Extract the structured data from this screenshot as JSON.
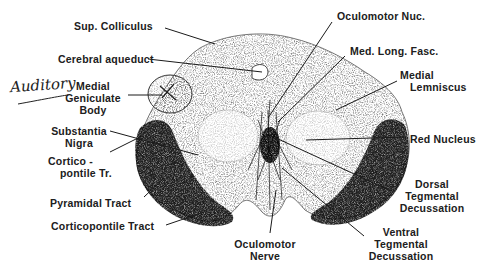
{
  "diagram": {
    "type": "anatomical-cross-section",
    "annotation_handwritten": "Auditory",
    "labels": [
      {
        "id": "sup-colliculus",
        "text": "Sup. Colliculus"
      },
      {
        "id": "cerebral-aqueduct",
        "text": "Cerebral aqueduct"
      },
      {
        "id": "medial-geniculate-body",
        "text": "Medial\nGeniculate\nBody",
        "lines": [
          "Medial",
          "Geniculate",
          "Body"
        ]
      },
      {
        "id": "substantia-nigra",
        "text": "Substantia Nigra",
        "lines": [
          "Substantia",
          "Nigra"
        ]
      },
      {
        "id": "corticopontile-tr",
        "text": "Cortico-pontile Tr.",
        "lines": [
          "Cortico -",
          "pontile  Tr."
        ]
      },
      {
        "id": "pyramidal-tract",
        "text": "Pyramidal Tract"
      },
      {
        "id": "corticopontile-tract",
        "text": "Corticopontile Tract"
      },
      {
        "id": "oculomotor-nerve",
        "text": "Oculomotor Nerve",
        "lines": [
          "Oculomotor",
          "Nerve"
        ]
      },
      {
        "id": "ventral-tegmental-decussation",
        "text": "Ventral Tegmental Decussation",
        "lines": [
          "Ventral",
          "Tegmental",
          "Decussation"
        ]
      },
      {
        "id": "dorsal-tegmental-decussation",
        "text": "Dorsal Tegmental Decussation",
        "lines": [
          "Dorsal",
          "Tegmental",
          "Decussation"
        ]
      },
      {
        "id": "red-nucleus",
        "text": "Red Nucleus"
      },
      {
        "id": "medial-lemniscus",
        "text": "Medial Lemniscus",
        "lines": [
          "Medial",
          "Lemniscus"
        ]
      },
      {
        "id": "med-long-fasc",
        "text": "Med. Long. Fasc."
      },
      {
        "id": "oculomotor-nuc",
        "text": "Oculomotor Nuc."
      }
    ]
  }
}
